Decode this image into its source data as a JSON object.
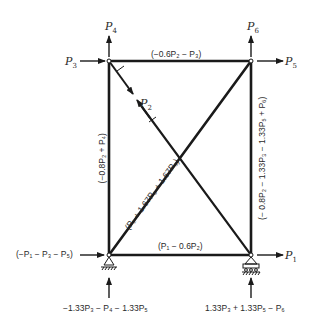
{
  "diagram": {
    "type": "truss-frame",
    "colors": {
      "member": "#1a1a1a",
      "text": "#2a2a2a",
      "background": "#ffffff"
    },
    "nodes": {
      "top_left": {
        "loads": {
          "up": "P4",
          "left_in": "P3"
        }
      },
      "top_right": {
        "loads": {
          "up": "P6",
          "right_out": "P5"
        }
      },
      "bottom_left": {
        "support": "pin",
        "loads": {
          "horizontal": "(-P1 - P3 - P5)",
          "vertical": "-1.33P3 - P4 - 1.33P5"
        }
      },
      "bottom_right": {
        "support": "roller",
        "loads": {
          "right_out": "P1",
          "vertical": "1.33P3 + 1.33P5 - P6"
        }
      }
    },
    "labels": {
      "p4": {
        "base": "P",
        "sub": "4"
      },
      "p3": {
        "base": "P",
        "sub": "3"
      },
      "p6": {
        "base": "P",
        "sub": "6"
      },
      "p5": {
        "base": "P",
        "sub": "5"
      },
      "p2": {
        "base": "P",
        "sub": "2"
      },
      "p1": {
        "base": "P",
        "sub": "1"
      },
      "top_member": "(−0.6P₂ − P₃)",
      "left_member": "(−0.8P₂ + P₄)",
      "right_member": "(− 0.8P₂ − 1.33P₃ − 1.33P₅ + P₆)",
      "diagonal_member": "(P₂ + 1.67P₃ + 1.67P₅)",
      "bottom_member": "(P₁ − 0.6P₂)",
      "left_horizontal_reaction": "(−P₁ − P₃ − P₅)",
      "left_vertical_reaction": "−1.33P₃ − P₄ − 1.33P₅",
      "right_vertical_reaction": "1.33P₃ + 1.33P₅ − P₆"
    }
  }
}
